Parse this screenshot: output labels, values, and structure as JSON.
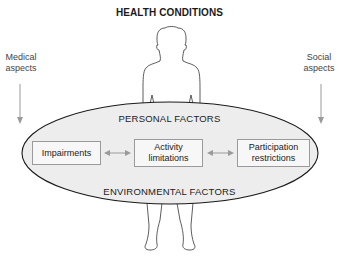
{
  "diagram": {
    "title": "HEALTH CONDITIONS",
    "side_labels": {
      "left": {
        "line1": "Medical",
        "line2": "aspects"
      },
      "right": {
        "line1": "Social",
        "line2": "aspects"
      }
    },
    "factors": {
      "personal": "PERSONAL FACTORS",
      "environmental": "ENVIRONMENTAL FACTORS"
    },
    "boxes": [
      {
        "id": "impairments",
        "line1": "Impairments",
        "line2": ""
      },
      {
        "id": "activity",
        "line1": "Activity",
        "line2": "limitations"
      },
      {
        "id": "participation",
        "line1": "Participation",
        "line2": "restrictions"
      }
    ],
    "connections": [
      {
        "from": "impairments",
        "to": "activity",
        "type": "bidirectional"
      },
      {
        "from": "activity",
        "to": "participation",
        "type": "bidirectional"
      }
    ],
    "colors": {
      "ellipse_fill": "#ededed",
      "ellipse_stroke": "#1a1a1a",
      "arrow": "#9a9a9a",
      "box_border": "#9a9a9a",
      "figure_stroke": "#333333"
    }
  }
}
